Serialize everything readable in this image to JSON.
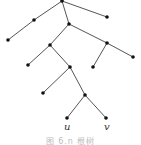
{
  "diagram": {
    "type": "rooted-tree",
    "nodes": [
      {
        "id": "root",
        "x": 62,
        "y": 1
      },
      {
        "id": "n1",
        "x": 34,
        "y": 20
      },
      {
        "id": "n2",
        "x": 107,
        "y": 17
      },
      {
        "id": "n3",
        "x": 69,
        "y": 24
      },
      {
        "id": "n4",
        "x": 8,
        "y": 40
      },
      {
        "id": "n5",
        "x": 50,
        "y": 45
      },
      {
        "id": "n6",
        "x": 107,
        "y": 43
      },
      {
        "id": "n7",
        "x": 28,
        "y": 65
      },
      {
        "id": "n8",
        "x": 70,
        "y": 67
      },
      {
        "id": "n9",
        "x": 93,
        "y": 67
      },
      {
        "id": "n10",
        "x": 133,
        "y": 57
      },
      {
        "id": "n11",
        "x": 43,
        "y": 93
      },
      {
        "id": "n12",
        "x": 85,
        "y": 95
      },
      {
        "id": "u",
        "x": 67,
        "y": 118
      },
      {
        "id": "v",
        "x": 106,
        "y": 118
      }
    ],
    "edges": [
      [
        "root",
        "n1"
      ],
      [
        "root",
        "n2"
      ],
      [
        "root",
        "n3"
      ],
      [
        "n1",
        "n4"
      ],
      [
        "n3",
        "n5"
      ],
      [
        "n3",
        "n6"
      ],
      [
        "n5",
        "n7"
      ],
      [
        "n5",
        "n8"
      ],
      [
        "n6",
        "n9"
      ],
      [
        "n6",
        "n10"
      ],
      [
        "n8",
        "n11"
      ],
      [
        "n8",
        "n12"
      ],
      [
        "n12",
        "u"
      ],
      [
        "n12",
        "v"
      ]
    ],
    "labels": {
      "u": "u",
      "v": "v"
    }
  },
  "caption": "图 6.n  根树"
}
